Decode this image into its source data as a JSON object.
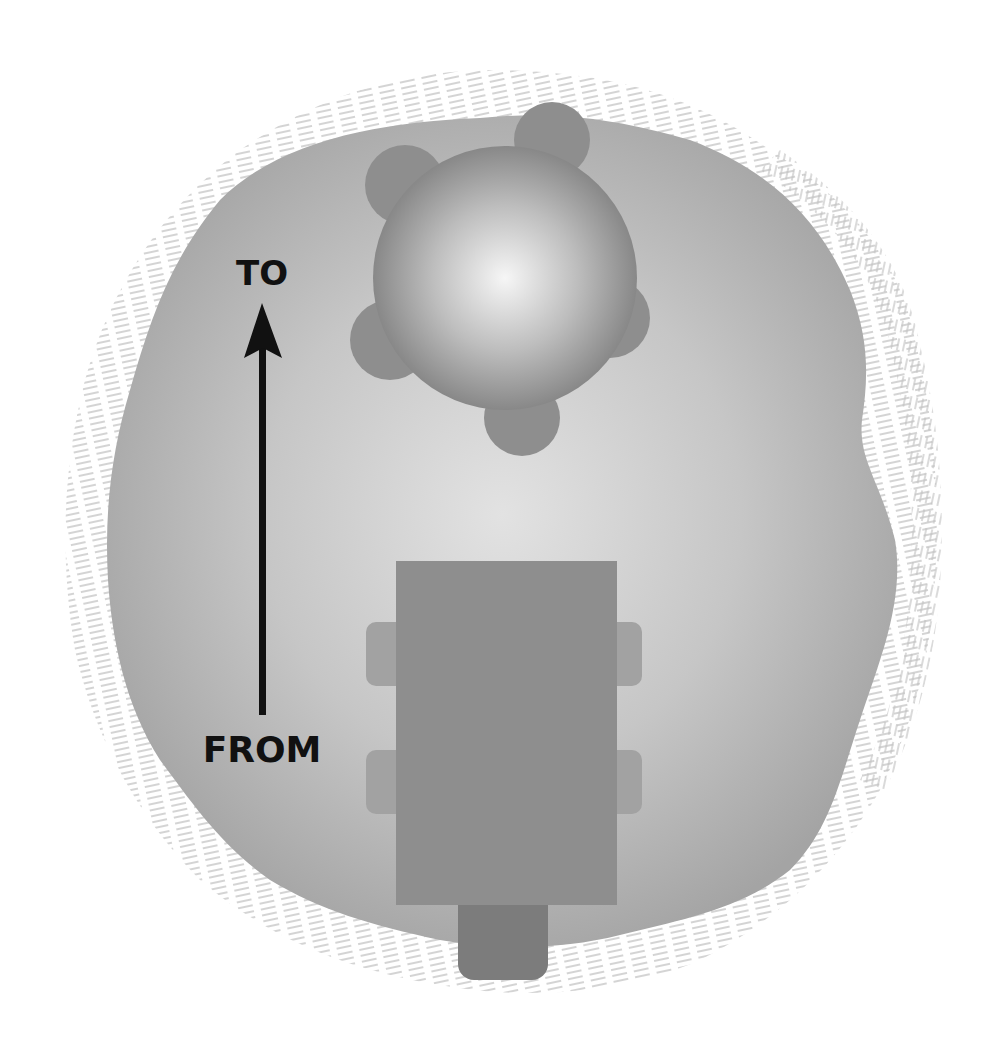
{
  "diagram": {
    "type": "floor-plan-illustration",
    "labels": {
      "to": "TO",
      "from": "FROM"
    },
    "elements": {
      "area": "rug-area",
      "round_table": {
        "shape": "circle",
        "chairs": 5
      },
      "rect_table": {
        "shape": "rectangle",
        "chairs": 5
      },
      "arrow": {
        "direction": "up",
        "from": "FROM",
        "to": "TO"
      }
    },
    "colors": {
      "background": "#ffffff",
      "area_fill": "#a8a8a8",
      "area_center": "#dcdcdc",
      "hatch": "#c4c4c4",
      "chair": "#8a8a8a",
      "table_rect": "#8c8c8c",
      "table_round_edge": "#7a7a7a",
      "table_round_highlight": "#f4f4f4",
      "side_chair": "#a0a0a0",
      "arrow": "#111111",
      "text": "#111111"
    }
  }
}
